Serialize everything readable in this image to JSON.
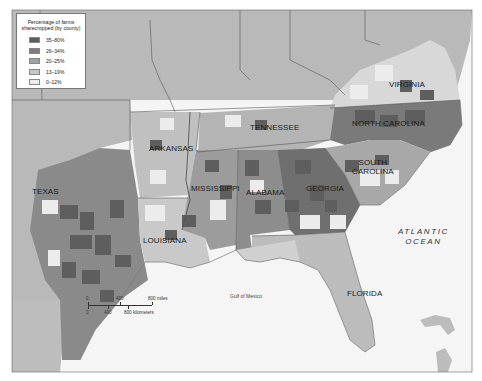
{
  "legend": {
    "title_line1": "Percentage of farms",
    "title_line2": "sharecropped (by county)",
    "items": [
      {
        "label": "35–80%",
        "color": "#5e5e5e"
      },
      {
        "label": "26–34%",
        "color": "#7d7d7d"
      },
      {
        "label": "20–25%",
        "color": "#a2a2a2"
      },
      {
        "label": "13–19%",
        "color": "#c6c6c6"
      },
      {
        "label": "0–12%",
        "color": "#ececec"
      }
    ]
  },
  "states": {
    "virginia": "VIRGINIA",
    "north_carolina": "NORTH CAROLINA",
    "tennessee": "TENNESSEE",
    "arkansas": "ARKANSAS",
    "south_carolina_1": "SOUTH",
    "south_carolina_2": "CAROLINA",
    "texas": "TEXAS",
    "mississippi": "MISSISSIPPI",
    "alabama": "ALABAMA",
    "georgia": "GEORGIA",
    "louisiana": "LOUISIANA",
    "florida": "FLORIDA"
  },
  "water": {
    "atlantic_1": "ATLANTIC",
    "atlantic_2": "OCEAN",
    "gulf": "Gulf of Mexico"
  },
  "scale": {
    "miles": [
      "0",
      "400",
      "800 miles"
    ],
    "km": [
      "0",
      "400",
      "800 kilometers"
    ]
  },
  "colors": {
    "other_land": "#b9b9b9",
    "water": "#f4f4f4",
    "border": "#555555"
  }
}
